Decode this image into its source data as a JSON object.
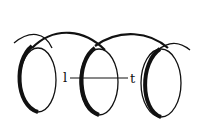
{
  "diagram": {
    "turns": 3,
    "labels": {
      "left": "l",
      "right": "t"
    },
    "colors": {
      "stroke": "#111111",
      "background": "#ffffff"
    }
  }
}
